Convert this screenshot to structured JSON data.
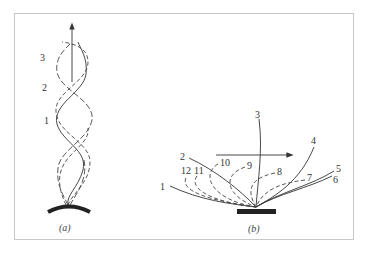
{
  "figure": {
    "panel_a": {
      "caption": "(a)",
      "labels": [
        "1",
        "2",
        "3"
      ]
    },
    "panel_b": {
      "caption": "(b)",
      "labels": [
        "1",
        "2",
        "3",
        "4",
        "5",
        "6",
        "7",
        "8",
        "9",
        "10",
        "11",
        "12"
      ]
    }
  },
  "colors": {
    "line": "#333333",
    "plate": "#222222",
    "frame": "#c8c8c8"
  }
}
